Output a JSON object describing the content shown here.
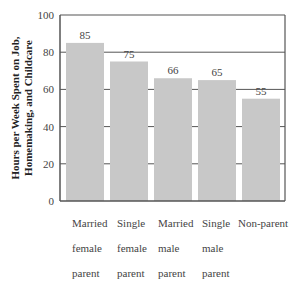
{
  "chart_data": {
    "type": "bar",
    "title": "",
    "xlabel": "",
    "ylabel": "Hours per Week Spent on Job, Homemaking, and Childcare",
    "ylabel_lines": [
      "Hours per Week Spent on Job,",
      "Homemaking, and Childcare"
    ],
    "categories": [
      "Married female parent",
      "Single female parent",
      "Married male parent",
      "Single male parent",
      "Non-parent"
    ],
    "category_lines": [
      [
        "Married",
        "female",
        "parent"
      ],
      [
        "Single",
        "female",
        "parent"
      ],
      [
        "Married",
        "male",
        "parent"
      ],
      [
        "Single",
        "male",
        "parent"
      ],
      [
        "Non-parent"
      ]
    ],
    "values": [
      85,
      75,
      66,
      65,
      55
    ],
    "data_labels": [
      "85",
      "75",
      "66",
      "65",
      "55"
    ],
    "ylim": [
      0,
      100
    ],
    "yticks": [
      0,
      20,
      40,
      60,
      80,
      100
    ],
    "ytick_labels": [
      "0",
      "20",
      "40",
      "60",
      "80",
      "100"
    ],
    "grid": true,
    "legend": null,
    "colors": {
      "bar": "#c8c8c8",
      "gridline": "#555555",
      "axis": "#555555",
      "text": "#444444"
    }
  }
}
